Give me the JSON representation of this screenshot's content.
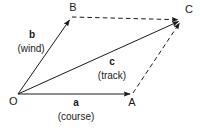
{
  "diagram": {
    "background_color": "#ffffff",
    "line_color": "#1a1a1a",
    "text_color": "#1a1a1a",
    "width": 200,
    "height": 128,
    "vertices": [
      {
        "id": "O",
        "label": "O",
        "x": 18,
        "y": 94,
        "label_x": 13,
        "label_y": 107
      },
      {
        "id": "A",
        "label": "A",
        "x": 132,
        "y": 94,
        "label_x": 132,
        "label_y": 108
      },
      {
        "id": "B",
        "label": "B",
        "x": 71,
        "y": 18,
        "label_x": 73,
        "label_y": 11
      },
      {
        "id": "C",
        "label": "C",
        "x": 181,
        "y": 20,
        "label_x": 189,
        "label_y": 13
      }
    ],
    "edges": [
      {
        "id": "OA",
        "from": "O",
        "to": "A",
        "style": "solid",
        "arrow": true,
        "vector": "a"
      },
      {
        "id": "OB",
        "from": "O",
        "to": "B",
        "style": "solid",
        "arrow": true,
        "vector": "b"
      },
      {
        "id": "OC",
        "from": "O",
        "to": "C",
        "style": "solid",
        "arrow": true,
        "vector": "c"
      },
      {
        "id": "BC",
        "from": "B",
        "to": "C",
        "style": "dashed",
        "arrow": true,
        "vector": ""
      },
      {
        "id": "AC",
        "from": "A",
        "to": "C",
        "style": "dashed",
        "arrow": true,
        "vector": ""
      }
    ],
    "vector_labels": [
      {
        "id": "a",
        "name": "a",
        "description": "(course)",
        "name_x": 76,
        "name_y": 105,
        "desc_x": 76,
        "desc_y": 119
      },
      {
        "id": "b",
        "name": "b",
        "description": "(wind)",
        "name_x": 32,
        "name_y": 37,
        "desc_x": 31,
        "desc_y": 51
      },
      {
        "id": "c",
        "name": "c",
        "description": "(track)",
        "name_x": 112,
        "name_y": 64,
        "desc_x": 112,
        "desc_y": 78
      }
    ]
  }
}
